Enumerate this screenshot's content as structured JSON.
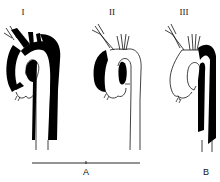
{
  "diagram": {
    "panels": [
      {
        "id": "type-1",
        "label": "I",
        "dissected_segments": [
          "ascending aorta",
          "aortic arch",
          "descending aorta"
        ]
      },
      {
        "id": "type-2",
        "label": "II",
        "dissected_segments": [
          "ascending aorta"
        ]
      },
      {
        "id": "type-3",
        "label": "III",
        "dissected_segments": [
          "descending aorta"
        ]
      }
    ],
    "groups": [
      {
        "id": "group-a",
        "label": "A",
        "spans": [
          "I",
          "II"
        ]
      },
      {
        "id": "group-b",
        "label": "B",
        "spans": [
          "III"
        ]
      }
    ],
    "colors": {
      "fill": "#000000",
      "stroke": "#111111",
      "background": "#ffffff"
    }
  }
}
